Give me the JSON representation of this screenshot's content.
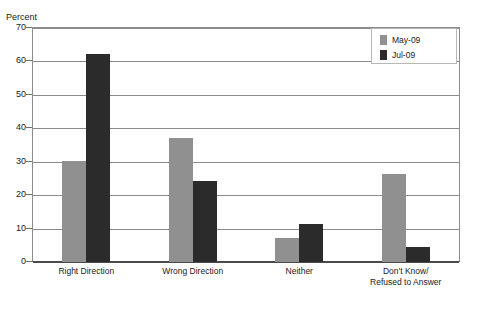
{
  "title_sliver": "",
  "axis": {
    "y_title": "Percent"
  },
  "legend": {
    "position": "top-right",
    "items": [
      {
        "label": "May-09",
        "color": "#909090"
      },
      {
        "label": "Jul-09",
        "color": "#2b2b2b"
      }
    ]
  },
  "chart_data": {
    "type": "bar",
    "title": "",
    "subtitle": "",
    "xlabel": "",
    "ylabel": "Percent",
    "ylim": [
      0,
      70
    ],
    "yticks": [
      0,
      10,
      20,
      30,
      40,
      50,
      60,
      70
    ],
    "ytick_labels": [
      "0",
      "10",
      "20",
      "30",
      "40",
      "50",
      "60",
      "70"
    ],
    "grid": true,
    "legend_position": "top-right",
    "categories": [
      "Right Direction",
      "Wrong Direction",
      "Neither",
      "Don't Know/\nRefused to Answer"
    ],
    "category_labels": [
      [
        "Right Direction"
      ],
      [
        "Wrong Direction"
      ],
      [
        "Neither"
      ],
      [
        "Don't Know/",
        "Refused to Answer"
      ]
    ],
    "series": [
      {
        "name": "May-09",
        "color": "#909090",
        "values": [
          30.2,
          37.2,
          7.2,
          26.3
        ]
      },
      {
        "name": "Jul-09",
        "color": "#2b2b2b",
        "values": [
          62.3,
          24.2,
          11.4,
          4.5
        ]
      }
    ]
  }
}
